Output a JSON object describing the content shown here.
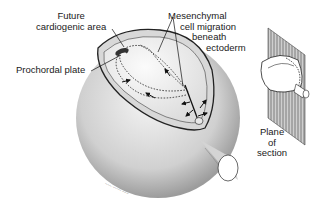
{
  "diagram": {
    "type": "embryology illustration",
    "labels": {
      "cardiogenic_line1": "Future",
      "cardiogenic_line2": "cardiogenic area",
      "prochordal": "Prochordal plate",
      "mesenchymal_line1": "Mesenchymal",
      "mesenchymal_line2": "cell migration",
      "mesenchymal_line3": "beneath",
      "mesenchymal_line4": "ectoderm",
      "plane_line1": "Plane",
      "plane_line2": "of",
      "plane_line3": "section"
    },
    "signature": "artist signature",
    "colors": {
      "ink": "#1a1a1a",
      "stipple": "#9a9a9a",
      "background": "#ffffff"
    }
  }
}
